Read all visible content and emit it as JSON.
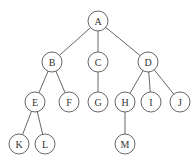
{
  "diagram": {
    "type": "tree",
    "node_radius": 10,
    "nodes": [
      {
        "id": "A",
        "label": "A",
        "x": 98,
        "y": 21
      },
      {
        "id": "B",
        "label": "B",
        "x": 52,
        "y": 62
      },
      {
        "id": "C",
        "label": "C",
        "x": 98,
        "y": 62
      },
      {
        "id": "D",
        "label": "D",
        "x": 148,
        "y": 62
      },
      {
        "id": "E",
        "label": "E",
        "x": 35,
        "y": 102
      },
      {
        "id": "F",
        "label": "F",
        "x": 69,
        "y": 102
      },
      {
        "id": "G",
        "label": "G",
        "x": 98,
        "y": 102
      },
      {
        "id": "H",
        "label": "H",
        "x": 125,
        "y": 102
      },
      {
        "id": "I",
        "label": "I",
        "x": 151,
        "y": 102
      },
      {
        "id": "J",
        "label": "J",
        "x": 180,
        "y": 102
      },
      {
        "id": "K",
        "label": "K",
        "x": 19,
        "y": 144
      },
      {
        "id": "L",
        "label": "L",
        "x": 45,
        "y": 144
      },
      {
        "id": "M",
        "label": "M",
        "x": 125,
        "y": 144
      }
    ],
    "edges": [
      [
        "A",
        "B"
      ],
      [
        "A",
        "C"
      ],
      [
        "A",
        "D"
      ],
      [
        "B",
        "E"
      ],
      [
        "B",
        "F"
      ],
      [
        "C",
        "G"
      ],
      [
        "D",
        "H"
      ],
      [
        "D",
        "I"
      ],
      [
        "D",
        "J"
      ],
      [
        "E",
        "K"
      ],
      [
        "E",
        "L"
      ],
      [
        "H",
        "M"
      ]
    ]
  }
}
